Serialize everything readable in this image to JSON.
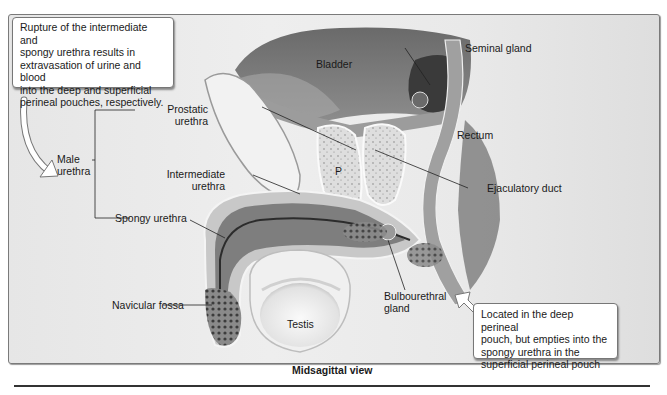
{
  "diagram": {
    "caption": "Midsagittal view",
    "callouts": {
      "rupture": "Rupture of the intermediate and spongy urethra results in extravasation of urine and blood into the deep and superficial perineal pouches, respectively.",
      "rupture_lines": [
        "Rupture of the intermediate and",
        "spongy urethra results in",
        "extravasation of urine and blood",
        "into the deep and superficial",
        "perineal pouches, respectively."
      ],
      "bulbourethral_lines": [
        "Located in the deep perineal",
        "pouch, but empties into the",
        "spongy urethra in the",
        "superficial perineal pouch"
      ]
    },
    "labels": {
      "bladder": "Bladder",
      "seminal_gland": "Seminal gland",
      "rectum": "Rectum",
      "ejaculatory_duct": "Ejaculatory duct",
      "prostatic_urethra_1": "Prostatic",
      "prostatic_urethra_2": "urethra",
      "male_urethra_1": "Male",
      "male_urethra_2": "urethra",
      "intermediate_urethra_1": "Intermediate",
      "intermediate_urethra_2": "urethra",
      "spongy_urethra": "Spongy urethra",
      "navicular_fossa": "Navicular fossa",
      "testis": "Testis",
      "bulbourethral_gland_1": "Bulbourethral",
      "bulbourethral_gland_2": "gland",
      "prostate_marker": "P"
    },
    "colors": {
      "frame_bg": "#e9e9e9",
      "frame_border": "#7a7a7a",
      "tissue_dark": "#5a5a5a",
      "tissue_mid": "#9a9a9a",
      "tissue_light": "#d8d8d8",
      "text": "#1a1a1a"
    }
  }
}
